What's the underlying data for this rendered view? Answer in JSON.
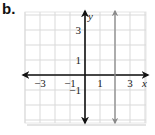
{
  "figure_label": "b.",
  "chart_data": {
    "type": "line",
    "title": "",
    "xlabel": "x",
    "ylabel": "y",
    "xlim": [
      -4,
      4
    ],
    "ylim": [
      -3.3,
      4.2
    ],
    "grid": true,
    "x_tick_labels": [
      "−3",
      "−1",
      "1",
      "3"
    ],
    "x_tick_values": [
      -3,
      -1,
      1,
      3
    ],
    "y_tick_labels": [
      "3",
      "1",
      "−1"
    ],
    "y_tick_values": [
      3,
      1,
      -1
    ],
    "series": [
      {
        "name": "vertical line x = 2",
        "equation": "x = 2",
        "points": [
          [
            2,
            -3.3
          ],
          [
            2,
            4.2
          ]
        ],
        "color": "#8a8a8a",
        "arrows": "both"
      }
    ],
    "axes_color": "#111111",
    "grid_color": "#d9d9d9"
  }
}
